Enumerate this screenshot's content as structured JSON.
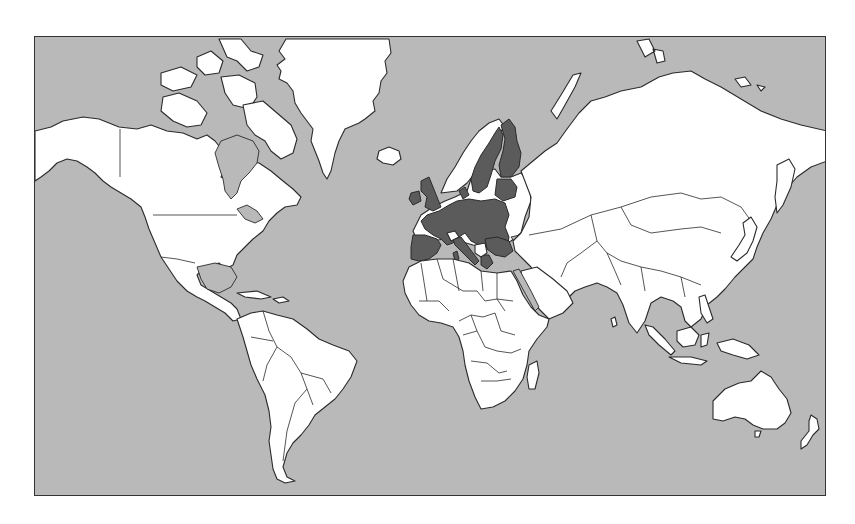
{
  "map": {
    "title": "",
    "projection": "mercator",
    "subject": "European Union member states highlighted on a world map",
    "colors": {
      "ocean": "#b9b9b9",
      "land": "#ffffff",
      "highlight": "#5b5b5b",
      "inland_sea": "#b9b9b9",
      "outline": "#2a2a2a",
      "frame": "#333333"
    },
    "highlighted_region": {
      "name": "European Union",
      "countries": [
        "Portugal",
        "Spain",
        "France",
        "Ireland",
        "United Kingdom",
        "Belgium",
        "Netherlands",
        "Luxembourg",
        "Germany",
        "Denmark",
        "Sweden",
        "Finland",
        "Estonia",
        "Latvia",
        "Lithuania",
        "Poland",
        "Czech Republic",
        "Slovakia",
        "Austria",
        "Slovenia",
        "Hungary",
        "Italy",
        "Croatia",
        "Romania",
        "Bulgaria",
        "Greece",
        "Cyprus",
        "Malta"
      ]
    },
    "non_highlighted_europe": [
      "Norway",
      "Iceland",
      "Switzerland",
      "Serbia",
      "Bosnia",
      "Albania",
      "Ukraine",
      "Belarus",
      "Moldova",
      "Russia",
      "Turkey"
    ],
    "continents": [
      "North America",
      "Greenland",
      "South America",
      "Europe",
      "Africa",
      "Asia",
      "Australia",
      "New Zealand",
      "Antarctica (not shown)"
    ],
    "legend": [],
    "labels": []
  }
}
